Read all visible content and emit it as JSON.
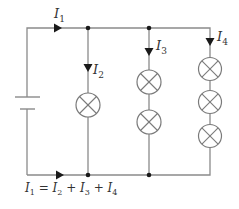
{
  "diagram": {
    "type": "parallel-circuit",
    "colors": {
      "wire": "#8a8a8a",
      "arrow": "#1a1a1a",
      "text": "#333333"
    },
    "components": {
      "battery": {
        "symbol": "cell"
      },
      "branches": [
        {
          "id": "branch-2",
          "current_label": "I",
          "current_sub": "2",
          "lamps": 1
        },
        {
          "id": "branch-3",
          "current_label": "I",
          "current_sub": "3",
          "lamps": 2
        },
        {
          "id": "branch-4",
          "current_label": "I",
          "current_sub": "4",
          "lamps": 3
        }
      ]
    },
    "labels": {
      "i1": {
        "var": "I",
        "sub": "1"
      },
      "i2": {
        "var": "I",
        "sub": "2"
      },
      "i3": {
        "var": "I",
        "sub": "3"
      },
      "i4": {
        "var": "I",
        "sub": "4"
      }
    },
    "equation": {
      "lhs_var": "I",
      "lhs_sub": "1",
      "equals": " = ",
      "t1_var": "I",
      "t1_sub": "2",
      "plus1": " + ",
      "t2_var": "I",
      "t2_sub": "3",
      "plus2": " + ",
      "t3_var": "I",
      "t3_sub": "4"
    }
  }
}
